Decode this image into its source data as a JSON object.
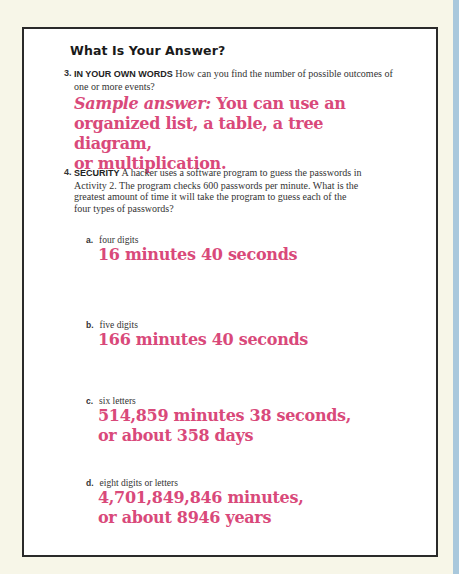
{
  "title": "What Is Your Answer?",
  "questions": [
    {
      "number": "3.",
      "heading": "IN YOUR OWN WORDS",
      "text": "How can you find the number of possible outcomes of one or more events?",
      "answer_lead": "Sample answer:",
      "answer_line1": "You can use an",
      "answer_line2": "organized list, a table, a tree diagram,",
      "answer_line3": "or multiplication."
    },
    {
      "number": "4.",
      "heading": "SECURITY",
      "text": "A hacker uses a software program to guess the passwords in Activity 2. The program checks 600 passwords per minute. What is the greatest amount of time it will take the program to guess each of the four types of passwords?",
      "parts": [
        {
          "letter": "a.",
          "label": "four digits",
          "answer_line1": "16 minutes 40 seconds",
          "answer_line2": ""
        },
        {
          "letter": "b.",
          "label": "five digits",
          "answer_line1": "166 minutes 40 seconds",
          "answer_line2": ""
        },
        {
          "letter": "c.",
          "label": "six letters",
          "answer_line1": "514,859 minutes 38 seconds,",
          "answer_line2": "or about 358 days"
        },
        {
          "letter": "d.",
          "label": "eight digits or letters",
          "answer_line1": "4,701,849,846 minutes,",
          "answer_line2": "or about 8946 years"
        }
      ]
    }
  ]
}
